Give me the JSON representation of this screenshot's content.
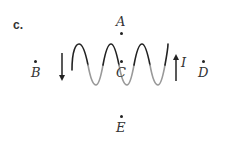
{
  "figure": {
    "part_label": "c.",
    "points": {
      "A": {
        "label": "A",
        "x": 121,
        "y": 33
      },
      "B": {
        "label": "B",
        "x": 35,
        "y": 61
      },
      "C": {
        "label": "C",
        "x": 121,
        "y": 61
      },
      "D": {
        "label": "D",
        "x": 203,
        "y": 61
      },
      "E": {
        "label": "E",
        "x": 121,
        "y": 116
      }
    },
    "current_label": "I",
    "coil": {
      "turns": 5,
      "x_start": 71,
      "x_end": 168,
      "top_y": 44,
      "bottom_y": 85
    },
    "arrows": {
      "left": {
        "direction": "down",
        "x": 62
      },
      "right": {
        "direction": "up",
        "x": 176
      }
    },
    "colors": {
      "ink": "#222222",
      "light_stroke": "#888888"
    }
  }
}
